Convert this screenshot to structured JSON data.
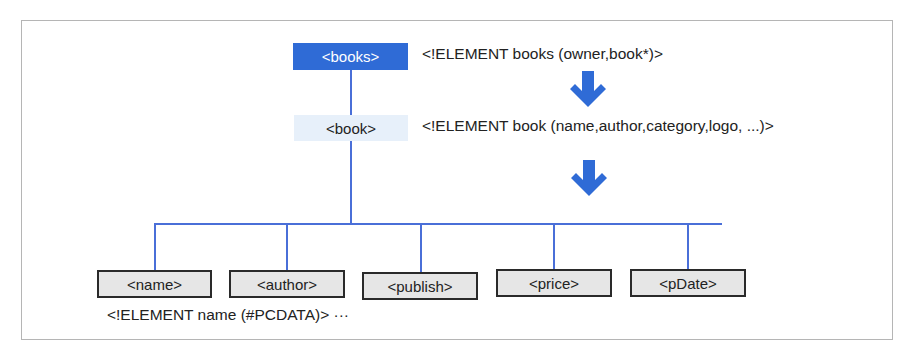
{
  "diagram": {
    "root": {
      "label": "<books>",
      "declaration": "<!ELEMENT books (owner,book*)>",
      "color": "#2f6bd6"
    },
    "child": {
      "label": "<book>",
      "declaration": "<!ELEMENT book (name,author,category,logo, ...)>",
      "color": "#e7f0fa"
    },
    "leaves": [
      {
        "label": "<name>"
      },
      {
        "label": "<author>"
      },
      {
        "label": "<publish>"
      },
      {
        "label": "<price>"
      },
      {
        "label": "<pDate>"
      }
    ],
    "leaf_declaration": "<!ELEMENT name (#PCDATA)> ···",
    "arrows": [
      "down-arrow",
      "down-arrow"
    ],
    "colors": {
      "connector": "#4a6fd8",
      "arrow": "#2f6bd6",
      "leaf_fill": "#e6e6e6",
      "leaf_border": "#2a2a2a",
      "frame_border": "#b5b5b5"
    }
  }
}
